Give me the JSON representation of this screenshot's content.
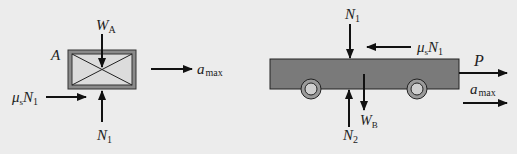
{
  "diagram": {
    "type": "free-body-diagram",
    "background": "#ececec",
    "colors": {
      "line": "#111111",
      "block_fill": "#d8d8d8",
      "block_frame": "#8a8a8a",
      "cart_fill": "#7a7a7a",
      "wheel_outer": "#9a9a9a",
      "wheel_inner": "#c8c8c8"
    },
    "block_A": {
      "label": "A",
      "forces": {
        "weight": {
          "symbol": "W",
          "subscript": "A",
          "direction": "down"
        },
        "normal": {
          "symbol": "N",
          "subscript": "1",
          "direction": "up"
        },
        "friction": {
          "symbol": "μ",
          "subscript_mu": "s",
          "symbol2": "N",
          "subscript": "1",
          "direction": "right"
        }
      },
      "acceleration": {
        "symbol": "a",
        "subscript": "max",
        "direction": "right"
      }
    },
    "cart_B": {
      "forces": {
        "normal_top": {
          "symbol": "N",
          "subscript": "1",
          "direction": "down"
        },
        "friction": {
          "symbol": "μ",
          "subscript_mu": "s",
          "symbol2": "N",
          "subscript": "1",
          "direction": "left"
        },
        "weight": {
          "symbol": "W",
          "subscript": "B",
          "direction": "down"
        },
        "normal_bottom": {
          "symbol": "N",
          "subscript": "2",
          "direction": "up"
        },
        "pull": {
          "symbol": "P",
          "direction": "right"
        }
      },
      "acceleration": {
        "symbol": "a",
        "subscript": "max",
        "direction": "right"
      },
      "wheels": 2
    }
  }
}
